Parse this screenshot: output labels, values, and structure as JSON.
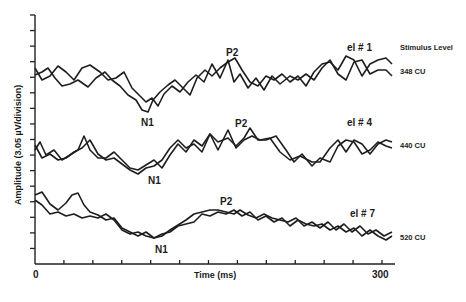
{
  "chart_data": {
    "type": "line",
    "title": "",
    "xlabel": "Time (ms)",
    "ylabel": "Amplitude (3.05 µV/division)",
    "xlim": [
      0,
      300
    ],
    "x_ticks": [
      0,
      300
    ],
    "x_tick_interval_ms": 25,
    "y_tick_count": 16,
    "legend_header": "Stimulus Level",
    "grid": false,
    "panels": [
      {
        "name": "el # 1",
        "stimulus_level": "348 CU",
        "peaks": {
          "N1": "N1",
          "P2": "P2"
        },
        "series": [
          {
            "name": "trace A",
            "points": "35,75 42,72 48,68 55,78 62,86 70,84 78,80 88,87 96,78 105,72 112,80 120,86 128,95 136,100 142,110 148,112 153,100 160,92 168,85 175,80 183,88 190,95 197,78 205,70 212,76 220,68 228,62 235,58 242,70 250,82 258,86 266,76 274,80 282,74 290,82 298,76 306,86 314,72 322,64 330,62 338,70 346,56 354,60 362,76 370,64 378,60 386,58 392,64"
          },
          {
            "name": "trace B",
            "points": "35,68 42,80 50,76 58,66 66,72 74,80 82,68 90,65 100,72 108,80 116,78 124,72 132,88 140,96 146,102 152,98 158,106 164,94 172,86 180,92 188,82 196,75 204,82 212,64 220,78 228,60 234,82 240,74 248,88 256,78 264,90 272,76 280,84 290,76 298,80 306,74 314,80 322,68 330,60 338,74 346,80 354,62 362,60 370,74 378,70 386,70 392,76"
          }
        ],
        "latency_ms": {
          "N1": 95,
          "P2": 170
        }
      },
      {
        "name": "el # 4",
        "stimulus_level": "440 CU",
        "peaks": {
          "N1": "N1",
          "P2": "P2"
        },
        "series": [
          {
            "name": "trace A",
            "points": "35,150 40,142 46,155 54,150 62,160 70,155 78,150 84,136 90,150 98,158 106,158 114,152 122,160 130,168 138,170 146,165 154,160 162,168 170,155 178,144 186,152 194,140 202,146 210,134 218,142 228,138 236,146 244,138 250,128 258,140 266,140 276,136 286,150 294,162 302,154 312,166 320,158 330,162 338,146 346,140 354,142 362,154 370,150 378,142 386,146 392,148"
          },
          {
            "name": "trace B",
            "points": "35,145 42,158 50,154 58,160 66,158 74,152 82,148 90,140 98,154 106,160 114,158 122,164 130,170 138,174 146,168 154,166 162,160 170,148 178,140 186,148 194,144 202,152 210,134 218,150 228,130 236,148 244,140 252,136 260,140 270,138 280,152 290,160 300,156 312,162 320,162 330,148 338,140 346,152 354,140 362,144 370,154 378,144 386,140 392,142"
          }
        ],
        "latency_ms": {
          "N1": 95,
          "P2": 175
        }
      },
      {
        "name": "el # 7",
        "stimulus_level": "520 CU",
        "peaks": {
          "N1": "N1",
          "P2": "P2"
        },
        "series": [
          {
            "name": "trace A",
            "points": "35,195 42,192 50,204 58,210 66,203 72,195 78,193 84,205 90,212 98,215 106,220 114,218 122,228 130,232 138,236 146,232 154,238 162,236 170,230 178,225 186,220 194,214 202,212 210,210 218,210 226,212 234,214 240,210 248,215 256,218 264,214 272,218 280,220 288,222 296,218 304,226 312,222 320,228 328,222 336,230 344,224 352,232 360,226 368,234 376,230 384,236 392,232"
          },
          {
            "name": "trace B",
            "points": "35,200 42,205 50,214 58,212 66,216 74,214 82,218 90,216 98,218 106,214 114,220 122,230 130,234 138,232 146,236 154,238 162,234 170,232 178,226 186,224 194,222 202,214 210,216 218,212 226,214 234,210 242,216 250,212 258,220 266,216 274,222 282,218 290,226 298,220 306,224 314,226 322,224 330,230 338,226 346,232 354,228 362,236 370,230 378,236 386,240 392,236"
          }
        ],
        "latency_ms": {
          "N1": 100,
          "P2": 165
        }
      }
    ]
  },
  "labels": {
    "ylabel": "Amplitude (3.05 µV/division)",
    "xlabel": "Time (ms)",
    "x0": "0",
    "x300": "300",
    "legend_header": "Stimulus Level",
    "panel1": {
      "el": "el # 1",
      "level": "348 CU",
      "n1": "N1",
      "p2": "P2"
    },
    "panel2": {
      "el": "el # 4",
      "level": "440 CU",
      "n1": "N1",
      "p2": "P2"
    },
    "panel3": {
      "el": "el # 7",
      "level": "520 CU",
      "n1": "N1",
      "p2": "P2"
    }
  },
  "colors": {
    "trace": "#1e1e1e",
    "axis": "#222222",
    "background": "#ffffff"
  }
}
